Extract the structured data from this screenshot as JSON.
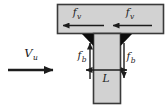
{
  "colors": {
    "background": "#ffffff",
    "member_fill": "#d2d2d2",
    "member_stroke": "#3a3a3a",
    "weld_fill": "#0d0d0d",
    "arrow": "#1c1c1c"
  },
  "labels": {
    "applied_shear": {
      "base": "V",
      "sub": "u"
    },
    "weld_shear_left": {
      "base": "f",
      "sub": "v"
    },
    "weld_shear_right": {
      "base": "f",
      "sub": "v"
    },
    "bending_stress_left": {
      "base": "f",
      "sub": "b"
    },
    "bending_stress_right": {
      "base": "f",
      "sub": "b"
    },
    "weld_length": {
      "base": "L"
    }
  }
}
